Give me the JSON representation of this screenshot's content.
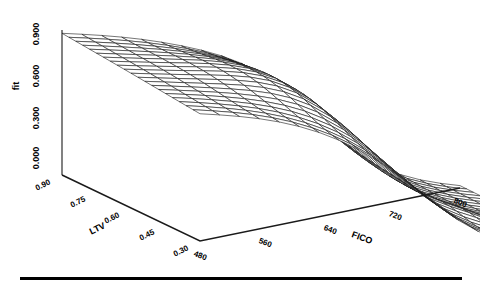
{
  "chart_data": {
    "type": "surface",
    "title": "",
    "xlabel": "FICO",
    "ylabel": "fit",
    "zlabel": "LTV",
    "x": [
      480,
      520,
      560,
      600,
      640,
      680,
      720,
      760,
      800
    ],
    "z": [
      0.3,
      0.45,
      0.6,
      0.75,
      0.9
    ],
    "xlim": [
      480,
      800
    ],
    "zlim": [
      0.3,
      0.9
    ],
    "ylim": [
      0.0,
      0.95
    ],
    "grid": false,
    "legend": "none",
    "wireframe_rows": 21,
    "wireframe_cols": 21,
    "surface_values": [
      [
        0.93,
        0.93,
        0.92,
        0.9,
        0.84,
        0.68,
        0.44,
        0.22,
        0.09
      ],
      [
        0.92,
        0.92,
        0.91,
        0.88,
        0.8,
        0.62,
        0.38,
        0.18,
        0.07
      ],
      [
        0.9,
        0.9,
        0.89,
        0.85,
        0.75,
        0.55,
        0.31,
        0.14,
        0.06
      ],
      [
        0.88,
        0.88,
        0.86,
        0.81,
        0.69,
        0.47,
        0.25,
        0.11,
        0.05
      ],
      [
        0.86,
        0.85,
        0.83,
        0.76,
        0.62,
        0.4,
        0.2,
        0.09,
        0.04
      ]
    ],
    "axis_tick_labels": {
      "fit": [
        "0.000",
        "0.300",
        "0.600",
        "0.900"
      ],
      "FICO": [
        "480",
        "560",
        "640",
        "720",
        "800"
      ],
      "LTV": [
        "0.90",
        "0.75",
        "0.60",
        "0.45",
        "0.30"
      ]
    }
  },
  "axes": {
    "y_title": "fit",
    "x_title": "FICO",
    "z_title": "LTV",
    "y_ticks": [
      "0.000",
      "0.300",
      "0.600",
      "0.900"
    ],
    "x_ticks": [
      "480",
      "560",
      "640",
      "720",
      "800"
    ],
    "z_ticks": [
      "0.90",
      "0.75",
      "0.60",
      "0.45",
      "0.30"
    ]
  },
  "style": {
    "line_color": "#1a1a1a",
    "background": "#ffffff",
    "rule_color": "#000000"
  }
}
